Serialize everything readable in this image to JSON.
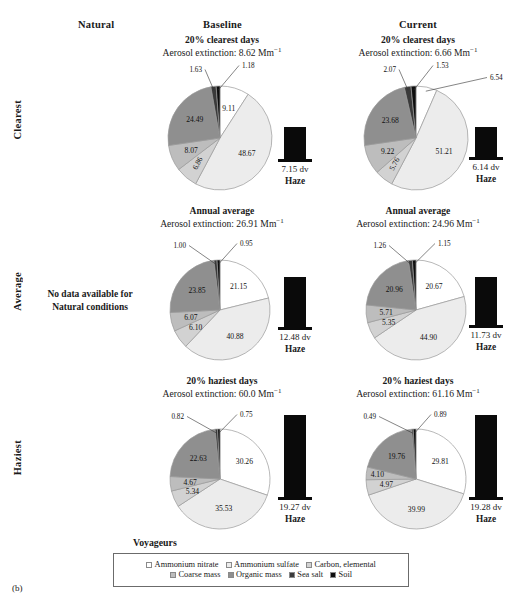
{
  "figure": {
    "caption": "(b)",
    "site_name": "Voyageurs",
    "no_data_note": "No data available for\nNatural conditions",
    "column_headers": [
      "Natural",
      "Baseline",
      "Current"
    ],
    "row_headers": [
      "Clearest",
      "Average",
      "Haziest"
    ]
  },
  "legend": {
    "title": "Voyageurs",
    "entries": [
      {
        "label": "Ammonium nitrate",
        "color": "#ffffff"
      },
      {
        "label": "Ammonium sulfate",
        "color": "#ececec"
      },
      {
        "label": "Carbon, elemental",
        "color": "#d2d2d2"
      },
      {
        "label": "Coarse mass",
        "color": "#bdbdbd"
      },
      {
        "label": "Organic mass",
        "color": "#8f8f8f"
      },
      {
        "label": "Sea salt",
        "color": "#3a3a3a"
      },
      {
        "label": "Soil",
        "color": "#0d0d0d"
      }
    ]
  },
  "chart_data": [
    {
      "type": "pie",
      "panel_id": "baseline-clearest",
      "column": "Baseline",
      "row": "Clearest",
      "title": "20% clearest days",
      "subtitle_prefix": "Aerosol extinction: ",
      "extinction": "8.62",
      "units": "Mm",
      "units_exp": "−1",
      "labels": [
        "Ammonium nitrate",
        "Ammonium sulfate",
        "Carbon, elemental",
        "Coarse mass",
        "Organic mass",
        "Sea salt",
        "Soil"
      ],
      "values": [
        9.11,
        48.67,
        6.86,
        8.07,
        24.49,
        1.63,
        1.18
      ],
      "colors": [
        "#ffffff",
        "#ececec",
        "#d2d2d2",
        "#bdbdbd",
        "#8f8f8f",
        "#3a3a3a",
        "#0d0d0d"
      ],
      "haze": {
        "value": "7.15 dv",
        "label": "Haze",
        "dv": 7.15
      }
    },
    {
      "type": "pie",
      "panel_id": "current-clearest",
      "column": "Current",
      "row": "Clearest",
      "title": "20% clearest days",
      "subtitle_prefix": "Aerosol extinction: ",
      "extinction": "6.66",
      "units": "Mm",
      "units_exp": "−1",
      "labels": [
        "Ammonium nitrate",
        "Ammonium sulfate",
        "Carbon, elemental",
        "Coarse mass",
        "Organic mass",
        "Sea salt",
        "Soil"
      ],
      "values": [
        6.54,
        51.21,
        5.76,
        9.22,
        23.68,
        2.07,
        1.53
      ],
      "colors": [
        "#ffffff",
        "#ececec",
        "#d2d2d2",
        "#bdbdbd",
        "#8f8f8f",
        "#3a3a3a",
        "#0d0d0d"
      ],
      "haze": {
        "value": "6.14 dv",
        "label": "Haze",
        "dv": 6.14
      }
    },
    {
      "type": "pie",
      "panel_id": "baseline-average",
      "column": "Baseline",
      "row": "Average",
      "title": "Annual average",
      "subtitle_prefix": "Aerosol extinction: ",
      "extinction": "26.91",
      "units": "Mm",
      "units_exp": "−1",
      "labels": [
        "Ammonium nitrate",
        "Ammonium sulfate",
        "Carbon, elemental",
        "Coarse mass",
        "Organic mass",
        "Sea salt",
        "Soil"
      ],
      "values": [
        21.15,
        40.88,
        6.1,
        6.07,
        23.85,
        1.0,
        0.95
      ],
      "colors": [
        "#ffffff",
        "#ececec",
        "#d2d2d2",
        "#bdbdbd",
        "#8f8f8f",
        "#3a3a3a",
        "#0d0d0d"
      ],
      "haze": {
        "value": "12.48 dv",
        "label": "Haze",
        "dv": 12.48
      }
    },
    {
      "type": "pie",
      "panel_id": "current-average",
      "column": "Current",
      "row": "Average",
      "title": "Annual average",
      "subtitle_prefix": "Aerosol extinction: ",
      "extinction": "24.96",
      "units": "Mm",
      "units_exp": "−1",
      "labels": [
        "Ammonium nitrate",
        "Ammonium sulfate",
        "Carbon, elemental",
        "Coarse mass",
        "Organic mass",
        "Sea salt",
        "Soil"
      ],
      "values": [
        20.67,
        44.9,
        5.35,
        5.71,
        20.96,
        1.26,
        1.15
      ],
      "colors": [
        "#ffffff",
        "#ececec",
        "#d2d2d2",
        "#bdbdbd",
        "#8f8f8f",
        "#3a3a3a",
        "#0d0d0d"
      ],
      "haze": {
        "value": "11.73 dv",
        "label": "Haze",
        "dv": 11.73
      }
    },
    {
      "type": "pie",
      "panel_id": "baseline-haziest",
      "column": "Baseline",
      "row": "Haziest",
      "title": "20% haziest days",
      "subtitle_prefix": "Aerosol extinction: ",
      "extinction": "60.0",
      "units": "Mm",
      "units_exp": "−1",
      "labels": [
        "Ammonium nitrate",
        "Ammonium sulfate",
        "Carbon, elemental",
        "Coarse mass",
        "Organic mass",
        "Sea salt",
        "Soil"
      ],
      "values": [
        30.26,
        35.53,
        5.34,
        4.67,
        22.63,
        0.82,
        0.75
      ],
      "colors": [
        "#ffffff",
        "#ececec",
        "#d2d2d2",
        "#bdbdbd",
        "#8f8f8f",
        "#3a3a3a",
        "#0d0d0d"
      ],
      "haze": {
        "value": "19.27 dv",
        "label": "Haze",
        "dv": 19.27
      }
    },
    {
      "type": "pie",
      "panel_id": "current-haziest",
      "column": "Current",
      "row": "Haziest",
      "title": "20% haziest days",
      "subtitle_prefix": "Aerosol extinction: ",
      "extinction": "61.16",
      "units": "Mm",
      "units_exp": "−1",
      "labels": [
        "Ammonium nitrate",
        "Ammonium sulfate",
        "Carbon, elemental",
        "Coarse mass",
        "Organic mass",
        "Sea salt",
        "Soil"
      ],
      "values": [
        29.81,
        39.99,
        4.97,
        4.1,
        19.76,
        0.49,
        0.89
      ],
      "colors": [
        "#ffffff",
        "#ececec",
        "#d2d2d2",
        "#bdbdbd",
        "#8f8f8f",
        "#3a3a3a",
        "#0d0d0d"
      ],
      "haze": {
        "value": "19.28 dv",
        "label": "Haze",
        "dv": 19.28
      }
    }
  ]
}
